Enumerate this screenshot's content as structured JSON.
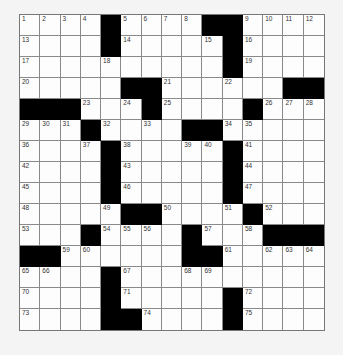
{
  "puzzle": {
    "rows": 15,
    "cols": 15,
    "colors": {
      "block": "#000000",
      "cell": "#fdfdfd",
      "background": "#f4f4f4"
    },
    "grid": [
      [
        "1",
        "2",
        "3",
        "4",
        "#",
        "5",
        "6",
        "7",
        "8",
        "#",
        "#",
        "9",
        "10",
        "11",
        "12"
      ],
      [
        "13",
        "",
        "",
        "",
        "#",
        "14",
        "",
        "",
        "",
        "15",
        "#",
        "16",
        "",
        "",
        ""
      ],
      [
        "17",
        "",
        "",
        "",
        "18",
        "",
        "",
        "",
        "",
        "",
        "#",
        "19",
        "",
        "",
        ""
      ],
      [
        "20",
        "",
        "",
        "",
        "",
        "#",
        "#",
        "21",
        "",
        "",
        "22",
        "",
        "",
        "#",
        "#"
      ],
      [
        "#",
        "#",
        "#",
        "23",
        "",
        "24",
        "#",
        "25",
        "",
        "",
        "",
        "#",
        "26",
        "27",
        "28"
      ],
      [
        "29",
        "30",
        "31",
        "#",
        "32",
        "",
        "33",
        "",
        "#",
        "#",
        "34",
        "35",
        "",
        "",
        ""
      ],
      [
        "36",
        "",
        "",
        "37",
        "#",
        "38",
        "",
        "",
        "39",
        "40",
        "#",
        "41",
        "",
        "",
        ""
      ],
      [
        "42",
        "",
        "",
        "",
        "#",
        "43",
        "",
        "",
        "",
        "",
        "#",
        "44",
        "",
        "",
        ""
      ],
      [
        "45",
        "",
        "",
        "",
        "#",
        "46",
        "",
        "",
        "",
        "",
        "#",
        "47",
        "",
        "",
        ""
      ],
      [
        "48",
        "",
        "",
        "",
        "49",
        "#",
        "#",
        "50",
        "",
        "",
        "51",
        "#",
        "52",
        "",
        ""
      ],
      [
        "53",
        "",
        "",
        "#",
        "54",
        "55",
        "56",
        "",
        "#",
        "57",
        "",
        "58",
        "#",
        "#",
        "#"
      ],
      [
        "#",
        "#",
        "59",
        "60",
        "",
        "",
        "",
        "",
        "#",
        "#",
        "61",
        "",
        "62",
        "63",
        "64"
      ],
      [
        "65",
        "66",
        "",
        "",
        "#",
        "67",
        "",
        "",
        "68",
        "69",
        "",
        "",
        "",
        "",
        ""
      ],
      [
        "70",
        "",
        "",
        "",
        "#",
        "71",
        "",
        "",
        "",
        "",
        "#",
        "72",
        "",
        "",
        ""
      ],
      [
        "73",
        "",
        "",
        "",
        "#",
        "#",
        "74",
        "",
        "",
        "",
        "#",
        "75",
        "",
        "",
        ""
      ]
    ]
  }
}
